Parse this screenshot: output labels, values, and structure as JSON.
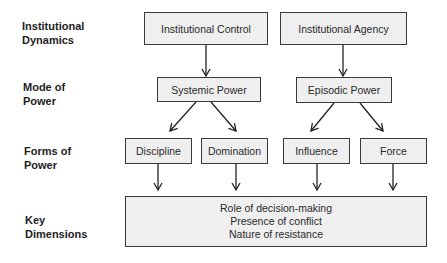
{
  "row_labels": {
    "institutional_dynamics": [
      "Institutional",
      "Dynamics"
    ],
    "mode_of_power": [
      "Mode of",
      "Power"
    ],
    "forms_of_power": [
      "Forms of",
      "Power"
    ],
    "key_dimensions": [
      "Key",
      "Dimensions"
    ]
  },
  "nodes": {
    "institutional_control": "Institutional Control",
    "institutional_agency": "Institutional Agency",
    "systemic_power": "Systemic Power",
    "episodic_power": "Episodic Power",
    "discipline": "Discipline",
    "domination": "Domination",
    "influence": "Influence",
    "force": "Force"
  },
  "key_dimensions": [
    "Role of decision-making",
    "Presence of conflict",
    "Nature of resistance"
  ],
  "edges": [
    [
      "institutional_control",
      "systemic_power"
    ],
    [
      "institutional_agency",
      "episodic_power"
    ],
    [
      "systemic_power",
      "discipline"
    ],
    [
      "systemic_power",
      "domination"
    ],
    [
      "episodic_power",
      "influence"
    ],
    [
      "episodic_power",
      "force"
    ],
    [
      "discipline",
      "key_dimensions"
    ],
    [
      "domination",
      "key_dimensions"
    ],
    [
      "influence",
      "key_dimensions"
    ],
    [
      "force",
      "key_dimensions"
    ]
  ]
}
